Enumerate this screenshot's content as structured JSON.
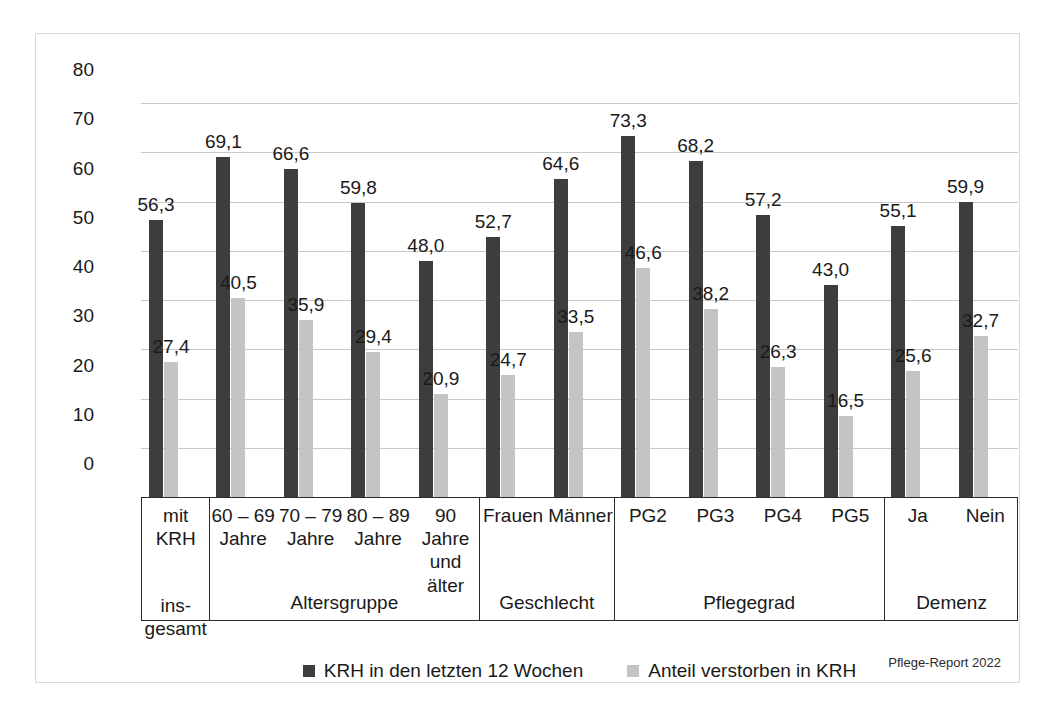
{
  "figure": {
    "source_note": "Pflege-Report 2022"
  },
  "legend": {
    "items": [
      {
        "label": "KRH in den letzten 12 Wochen",
        "color": "#3d3d3d",
        "key": "krh"
      },
      {
        "label": "Anteil verstorben in KRH",
        "color": "#c4c4c4",
        "key": "verstorben"
      }
    ]
  },
  "chart_data": {
    "type": "bar",
    "title": "",
    "xlabel": "",
    "ylabel": "",
    "ylim": [
      0,
      80
    ],
    "ytick_step": 10,
    "yticks": [
      "0",
      "10",
      "20",
      "30",
      "40",
      "50",
      "60",
      "70",
      "80"
    ],
    "grid": true,
    "legend_position": "bottom-center",
    "value_decimal_separator": ",",
    "categories": [
      "mit KRH",
      "60 – 69 Jahre",
      "70 – 79 Jahre",
      "80 – 89 Jahre",
      "90 Jahre und älter",
      "Frauen",
      "Männer",
      "PG2",
      "PG3",
      "PG4",
      "PG5",
      "Ja",
      "Nein"
    ],
    "category_lines": [
      [
        "mit",
        "KRH"
      ],
      [
        "60 – 69",
        "Jahre"
      ],
      [
        "70 – 79",
        "Jahre"
      ],
      [
        "80 – 89",
        "Jahre"
      ],
      [
        "90",
        "Jahre",
        "und",
        "älter"
      ],
      [
        "Frauen"
      ],
      [
        "Männer"
      ],
      [
        "PG2"
      ],
      [
        "PG3"
      ],
      [
        "PG4"
      ],
      [
        "PG5"
      ],
      [
        "Ja"
      ],
      [
        "Nein"
      ]
    ],
    "series": [
      {
        "name": "KRH in den letzten 12 Wochen",
        "color": "#3d3d3d",
        "values": [
          56.3,
          69.1,
          66.6,
          59.8,
          48.0,
          52.7,
          64.6,
          73.3,
          68.2,
          57.2,
          43.0,
          55.1,
          59.9
        ],
        "labels": [
          "56,3",
          "69,1",
          "66,6",
          "59,8",
          "48,0",
          "52,7",
          "64,6",
          "73,3",
          "68,2",
          "57,2",
          "43,0",
          "55,1",
          "59,9"
        ]
      },
      {
        "name": "Anteil verstorben in KRH",
        "color": "#c4c4c4",
        "values": [
          27.4,
          40.5,
          35.9,
          29.4,
          20.9,
          24.7,
          33.5,
          46.6,
          38.2,
          26.3,
          16.5,
          25.6,
          32.7
        ],
        "labels": [
          "27,4",
          "40,5",
          "35,9",
          "29,4",
          "20,9",
          "24,7",
          "33,5",
          "46,6",
          "38,2",
          "26,3",
          "16,5",
          "25,6",
          "32,7"
        ]
      }
    ],
    "groups": [
      {
        "label": "insgesamt",
        "label_lines": [
          "ins-",
          "gesamt"
        ],
        "span": 1
      },
      {
        "label": "Altersgruppe",
        "label_lines": [
          "Altersgruppe"
        ],
        "span": 4
      },
      {
        "label": "Geschlecht",
        "label_lines": [
          "Geschlecht"
        ],
        "span": 2
      },
      {
        "label": "Pflegegrad",
        "label_lines": [
          "Pflegegrad"
        ],
        "span": 4
      },
      {
        "label": "Demenz",
        "label_lines": [
          "Demenz"
        ],
        "span": 2
      }
    ]
  }
}
